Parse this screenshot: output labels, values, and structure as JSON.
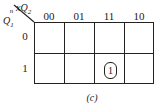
{
  "kmap": {
    "column_variable": "xQ2n",
    "column_variable_display": {
      "base1": "x",
      "base2": "Q",
      "sup": "n",
      "sub": "2"
    },
    "row_variable_display": {
      "base": "Q",
      "sup": "n",
      "sub": "1"
    },
    "column_headers": [
      "00",
      "01",
      "11",
      "10"
    ],
    "row_headers": [
      "0",
      "1"
    ],
    "cells": [
      [
        "",
        "",
        "",
        ""
      ],
      [
        "",
        "",
        "1",
        ""
      ]
    ],
    "groupings": [
      {
        "row": 1,
        "col": 2,
        "value": "1"
      }
    ]
  },
  "caption": "(c)"
}
